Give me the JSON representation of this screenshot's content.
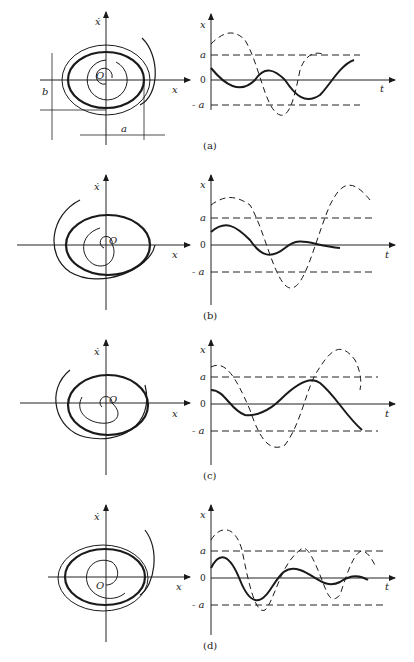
{
  "figure": {
    "panels": [
      {
        "id": "a",
        "caption": "(a)",
        "phase": {
          "y_label": "ẋ",
          "x_label": "x",
          "origin_label": "O",
          "dim_a": "a",
          "dim_b": "b"
        },
        "time": {
          "y_label": "x",
          "t_label": "t",
          "ticks": [
            "a",
            "0",
            "- a"
          ]
        }
      },
      {
        "id": "b",
        "caption": "(b)",
        "phase": {
          "y_label": "ẋ",
          "x_label": "x",
          "origin_label": "O"
        },
        "time": {
          "y_label": "x",
          "t_label": "t",
          "ticks": [
            "a",
            "0",
            "- a"
          ]
        }
      },
      {
        "id": "c",
        "caption": "(c)",
        "phase": {
          "y_label": "ẋ",
          "x_label": "x",
          "origin_label": "O"
        },
        "time": {
          "y_label": "x",
          "t_label": "t",
          "ticks": [
            "a",
            "0",
            "- a"
          ]
        }
      },
      {
        "id": "d",
        "caption": "(d)",
        "phase": {
          "y_label": "ẋ",
          "x_label": "x",
          "origin_label": "O"
        },
        "time": {
          "y_label": "x",
          "t_label": "t",
          "ticks": [
            "a",
            "0",
            "- a"
          ]
        }
      }
    ]
  }
}
